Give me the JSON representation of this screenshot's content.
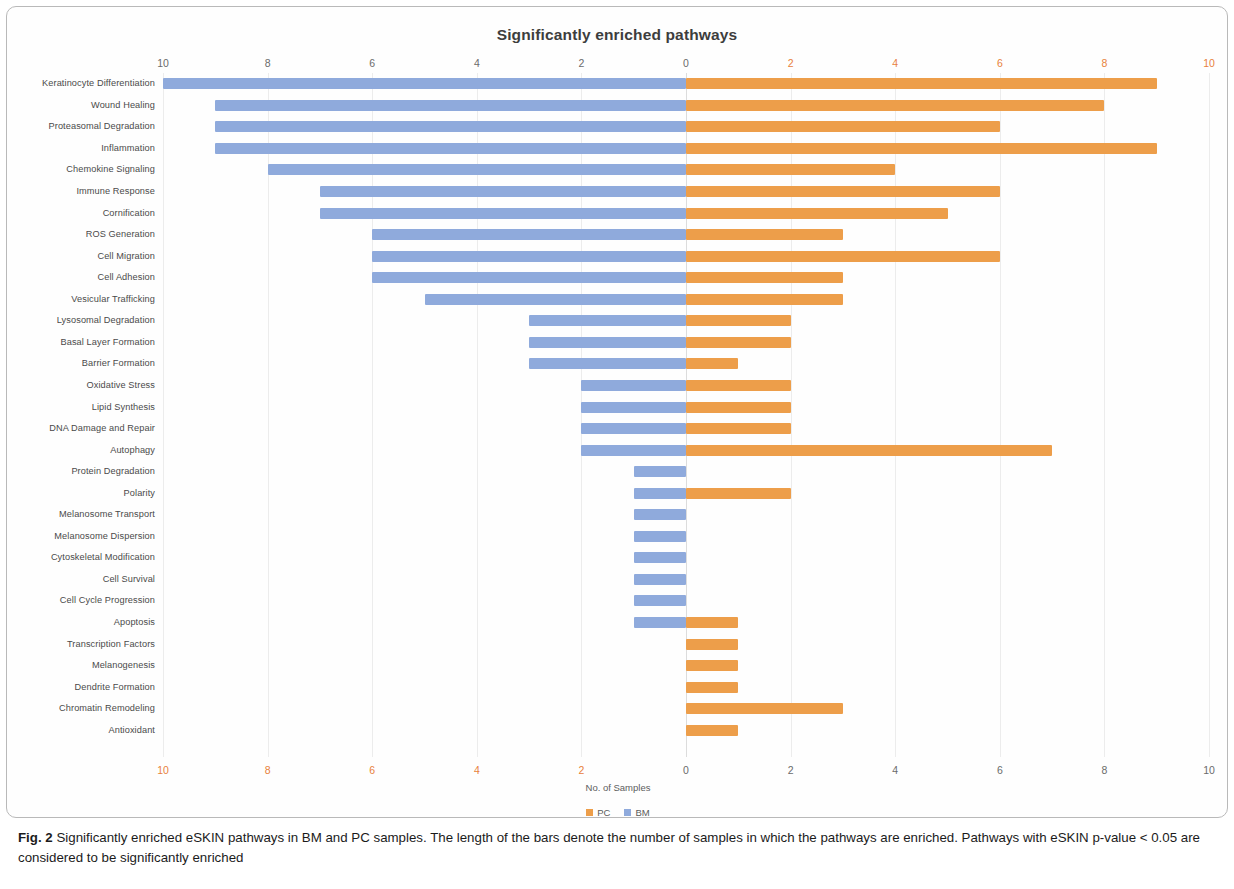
{
  "figure": {
    "chart_title": "Significantly enriched pathways",
    "caption_label": "Fig. 2",
    "caption_text": " Significantly enriched eSKIN pathways in BM and PC samples. The length of the bars denote the number of samples in which the pathways are enriched. Pathways with eSKIN p-value < 0.05 are considered to be significantly enriched"
  },
  "legend": {
    "items": [
      {
        "label": "PC",
        "color": "#ed9e4a"
      },
      {
        "label": "BM",
        "color": "#8faadc"
      }
    ]
  },
  "chart_data": {
    "type": "bar",
    "orientation": "horizontal",
    "layout": "diverging-bidirectional",
    "title": "Significantly enriched pathways",
    "xlabel": "No. of Samples",
    "ylabel": "",
    "xlim": [
      -10,
      10
    ],
    "grid": true,
    "legend_position": "bottom-center",
    "axis_ticks_top": [
      {
        "value": -10,
        "label": "10",
        "color": "#6b6b6b"
      },
      {
        "value": -8,
        "label": "8",
        "color": "#6b6b6b"
      },
      {
        "value": -6,
        "label": "6",
        "color": "#6b6b6b"
      },
      {
        "value": -4,
        "label": "4",
        "color": "#6b6b6b"
      },
      {
        "value": -2,
        "label": "2",
        "color": "#6b6b6b"
      },
      {
        "value": 0,
        "label": "0",
        "color": "#6b6b6b"
      },
      {
        "value": 2,
        "label": "2",
        "color": "#e8813c"
      },
      {
        "value": 4,
        "label": "4",
        "color": "#e8813c"
      },
      {
        "value": 6,
        "label": "6",
        "color": "#e8813c"
      },
      {
        "value": 8,
        "label": "8",
        "color": "#e8813c"
      },
      {
        "value": 10,
        "label": "10",
        "color": "#e8813c"
      }
    ],
    "axis_ticks_bottom": [
      {
        "value": -10,
        "label": "10",
        "color": "#e8813c"
      },
      {
        "value": -8,
        "label": "8",
        "color": "#e8813c"
      },
      {
        "value": -6,
        "label": "6",
        "color": "#e8813c"
      },
      {
        "value": -4,
        "label": "4",
        "color": "#e8813c"
      },
      {
        "value": -2,
        "label": "2",
        "color": "#e8813c"
      },
      {
        "value": 0,
        "label": "0",
        "color": "#6b6b6b"
      },
      {
        "value": 2,
        "label": "2",
        "color": "#6b6b6b"
      },
      {
        "value": 4,
        "label": "4",
        "color": "#6b6b6b"
      },
      {
        "value": 6,
        "label": "6",
        "color": "#6b6b6b"
      },
      {
        "value": 8,
        "label": "8",
        "color": "#6b6b6b"
      },
      {
        "value": 10,
        "label": "10",
        "color": "#6b6b6b"
      }
    ],
    "categories": [
      "Keratinocyte Differentiation",
      "Wound Healing",
      "Proteasomal Degradation",
      "Inflammation",
      "Chemokine Signaling",
      "Immune Response",
      "Cornification",
      "ROS Generation",
      "Cell Migration",
      "Cell Adhesion",
      "Vesicular Trafficking",
      "Lysosomal Degradation",
      "Basal Layer Formation",
      "Barrier Formation",
      "Oxidative Stress",
      "Lipid Synthesis",
      "DNA Damage and Repair",
      "Autophagy",
      "Protein Degradation",
      "Polarity",
      "Melanosome Transport",
      "Melanosome Dispersion",
      "Cytoskeletal Modification",
      "Cell Survival",
      "Cell Cycle Progression",
      "Apoptosis",
      "Transcription Factors",
      "Melanogenesis",
      "Dendrite Formation",
      "Chromatin Remodeling",
      "Antioxidant"
    ],
    "series": [
      {
        "name": "BM",
        "color": "#8faadc",
        "direction": "left",
        "values": [
          10,
          9,
          9,
          9,
          8,
          7,
          7,
          6,
          6,
          6,
          5,
          3,
          3,
          3,
          2,
          2,
          2,
          2,
          1,
          1,
          1,
          1,
          1,
          1,
          1,
          1,
          0,
          0,
          0,
          0,
          0
        ]
      },
      {
        "name": "PC",
        "color": "#ed9e4a",
        "direction": "right",
        "values": [
          9,
          8,
          6,
          9,
          4,
          6,
          5,
          3,
          6,
          3,
          3,
          2,
          2,
          1,
          2,
          2,
          2,
          7,
          0,
          2,
          0,
          0,
          0,
          0,
          0,
          1,
          1,
          1,
          1,
          3,
          1
        ]
      }
    ]
  }
}
